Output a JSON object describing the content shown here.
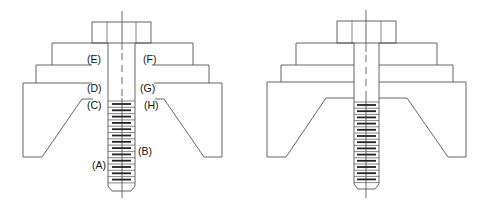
{
  "figure": {
    "colors": {
      "line": "#555555",
      "thread_bar": "#222222",
      "label": "#111111",
      "background": "#ffffff"
    },
    "left_view": {
      "labels": {
        "A": "(A)",
        "B": "(B)",
        "C": "(C)",
        "D": "(D)",
        "E": "(E)",
        "F": "(F)",
        "G": "(G)",
        "H": "(H)"
      },
      "thread_count": 13
    },
    "right_view": {
      "labels": {},
      "thread_count": 13
    }
  }
}
